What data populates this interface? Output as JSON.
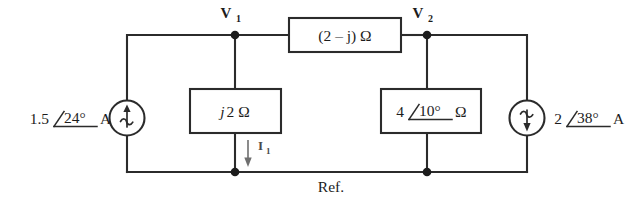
{
  "figure": {
    "type": "circuit-schematic"
  },
  "nodes": {
    "v1": {
      "label": "V",
      "subscript": "1"
    },
    "v2": {
      "label": "V",
      "subscript": "2"
    },
    "reference": {
      "label": "Ref."
    }
  },
  "sources": {
    "left": {
      "magnitude": "1.5",
      "angle": "24°",
      "unit": "A",
      "symbol": "current-source-ac",
      "arrow_direction": "up"
    },
    "right": {
      "magnitude": "2",
      "angle": "38°",
      "unit": "A",
      "symbol": "current-source-ac",
      "arrow_direction": "down"
    }
  },
  "impedances": {
    "top": {
      "value": "(2 – j) Ω"
    },
    "left": {
      "value_italic": "j",
      "value_rest": "2 Ω"
    },
    "right": {
      "magnitude": "4",
      "angle": "10°",
      "unit": "Ω"
    }
  },
  "currents": {
    "i1": {
      "label": "I",
      "subscript": "1",
      "direction": "down"
    }
  }
}
